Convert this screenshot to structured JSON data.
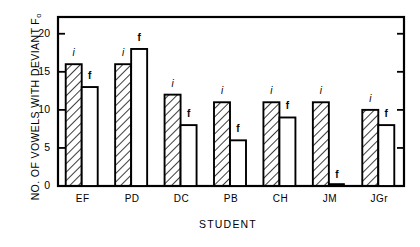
{
  "chart_data": {
    "type": "bar",
    "title": "",
    "subtitle": "",
    "xlabel": "STUDENT",
    "ylabel": "NO. OF VOWELS WITH DEVIANT F",
    "ylabel_sub": "o",
    "categories": [
      "EF",
      "PD",
      "DC",
      "PB",
      "CH",
      "JM",
      "JGr"
    ],
    "series": [
      {
        "name": "i",
        "label": "i",
        "style": "hatched",
        "values": [
          16,
          16,
          12,
          11,
          11,
          11,
          10
        ]
      },
      {
        "name": "f",
        "label": "f",
        "style": "open",
        "values": [
          13,
          18,
          8,
          6,
          9,
          0,
          8
        ]
      }
    ],
    "yticks": [
      0,
      5,
      10,
      15,
      20
    ],
    "ytick_labels": [
      "0",
      "5",
      "10",
      "15",
      "20"
    ],
    "ylim": [
      0,
      22.2
    ],
    "grid": false,
    "legend": "none",
    "frame": "box"
  },
  "colors": {
    "axis": "#000000",
    "bar_outline": "#000000",
    "bar_open_fill": "#ffffff",
    "hatch": "#1a1a1a",
    "background": "#ffffff"
  }
}
